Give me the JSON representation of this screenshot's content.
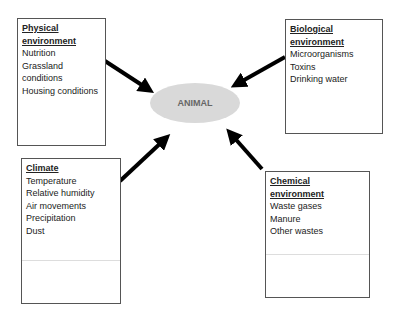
{
  "center": {
    "label": "ANIMAL",
    "color": "#d9d9d9"
  },
  "boxes": {
    "physical": {
      "title_line1": "Physical",
      "title_line2": "environment",
      "items": [
        "Nutrition",
        "Grassland",
        "conditions",
        "Housing conditions"
      ]
    },
    "biological": {
      "title_line1": "Biological",
      "title_line2": "environment",
      "items": [
        "Microorganisms",
        "Toxins",
        "Drinking water"
      ]
    },
    "climate": {
      "title_line1": "Climate",
      "items": [
        "Temperature",
        "Relative humidity",
        "Air movements",
        "Precipitation",
        "Dust"
      ]
    },
    "chemical": {
      "title_line1": "Chemical",
      "title_line2": "environment",
      "items": [
        "Waste gases",
        "Manure",
        "Other wastes"
      ]
    }
  },
  "arrows": [
    {
      "from": "physical",
      "to": "center"
    },
    {
      "from": "biological",
      "to": "center"
    },
    {
      "from": "climate",
      "to": "center"
    },
    {
      "from": "chemical",
      "to": "center"
    }
  ]
}
